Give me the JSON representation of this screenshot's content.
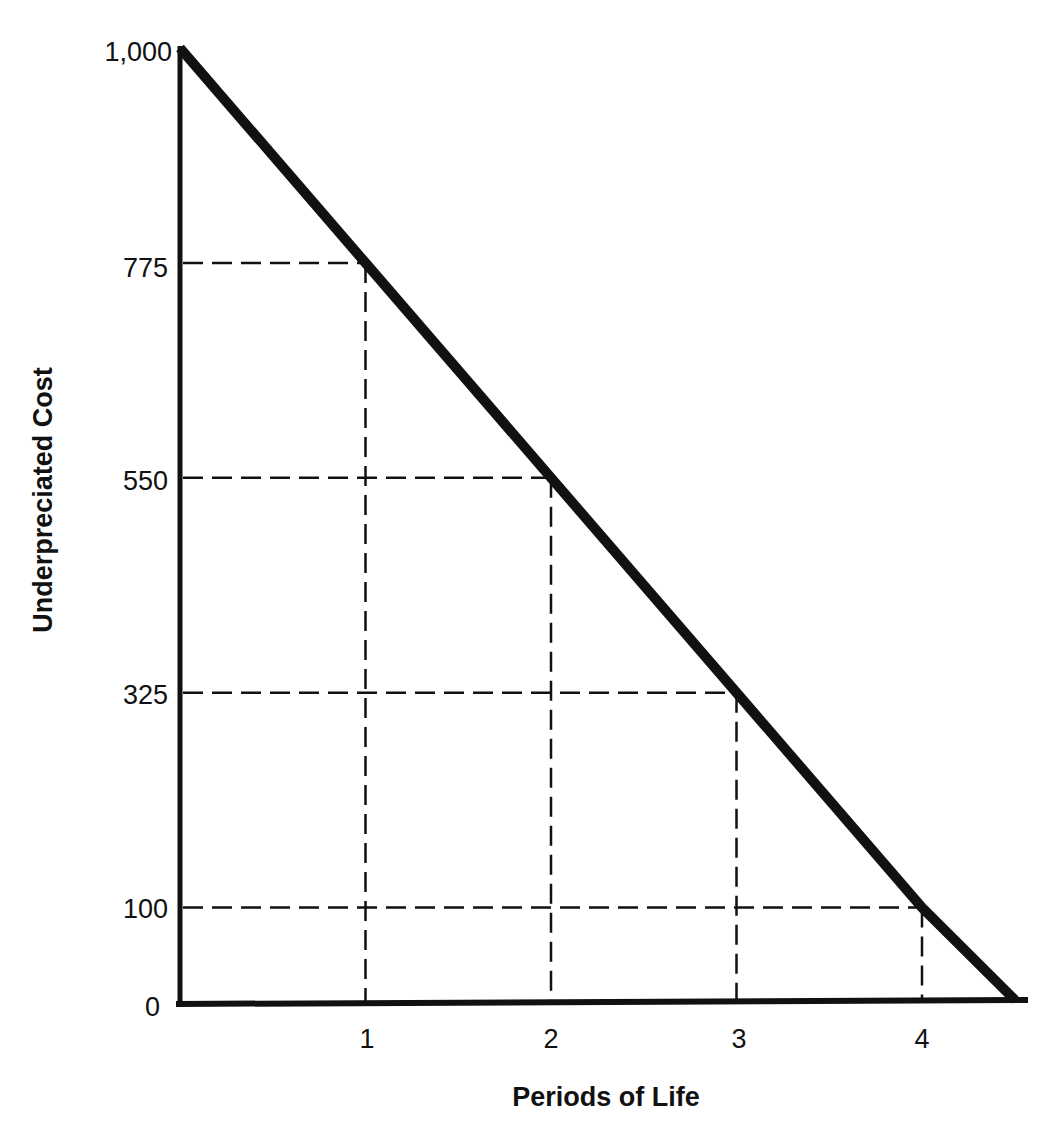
{
  "chart_data": {
    "type": "line",
    "title": "",
    "xlabel": "Periods of Life",
    "ylabel": "Underpreciated Cost",
    "x_ticks": [
      "1",
      "2",
      "3",
      "4"
    ],
    "y_ticks": [
      "0",
      "100",
      "325",
      "550",
      "775",
      "1,000"
    ],
    "series": [
      {
        "name": "Underpreciated Cost",
        "x": [
          0,
          1,
          2,
          3,
          4,
          4.5
        ],
        "values": [
          1000,
          775,
          550,
          325,
          100,
          0
        ]
      }
    ],
    "reference_lines": "dashed guides from each labeled point to both axes",
    "xlim": [
      0,
      4.6
    ],
    "ylim": [
      0,
      1000
    ],
    "grid": false,
    "legend": "none",
    "colors": {
      "line": "#111111",
      "axis": "#111111",
      "guide": "#111111",
      "background": "#ffffff"
    }
  }
}
